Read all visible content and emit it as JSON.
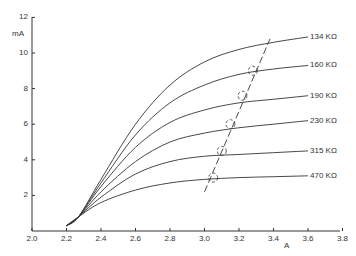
{
  "chart_data": {
    "type": "line",
    "title": "",
    "xlabel": "A",
    "ylabel": "mA",
    "xlim": [
      2.0,
      3.8
    ],
    "ylim": [
      0,
      12
    ],
    "grid": false,
    "x_ticks": [
      "2.0",
      "2.2",
      "2.4",
      "2.6",
      "2.8",
      "3.0",
      "3.2",
      "3.4",
      "3.6",
      "3.8"
    ],
    "y_ticks": [
      "2",
      "4",
      "6",
      "8",
      "10",
      "12"
    ],
    "series": [
      {
        "name": "134 KΩ",
        "x": [
          2.2,
          2.27,
          2.4,
          2.6,
          2.8,
          3.0,
          3.2,
          3.4,
          3.6
        ],
        "values": [
          0.3,
          0.8,
          2.9,
          6.0,
          8.2,
          9.5,
          10.2,
          10.6,
          10.9
        ]
      },
      {
        "name": "160 KΩ",
        "x": [
          2.2,
          2.27,
          2.4,
          2.6,
          2.8,
          3.0,
          3.2,
          3.4,
          3.6
        ],
        "values": [
          0.3,
          0.8,
          2.7,
          5.4,
          7.2,
          8.2,
          8.8,
          9.1,
          9.3
        ]
      },
      {
        "name": "190 KΩ",
        "x": [
          2.2,
          2.27,
          2.4,
          2.6,
          2.8,
          3.0,
          3.2,
          3.4,
          3.6
        ],
        "values": [
          0.3,
          0.8,
          2.5,
          4.7,
          6.1,
          6.8,
          7.2,
          7.4,
          7.6
        ]
      },
      {
        "name": "230 KΩ",
        "x": [
          2.2,
          2.27,
          2.4,
          2.6,
          2.8,
          3.0,
          3.2,
          3.4,
          3.6
        ],
        "values": [
          0.3,
          0.8,
          2.2,
          3.9,
          5.0,
          5.5,
          5.8,
          6.0,
          6.2
        ]
      },
      {
        "name": "315 KΩ",
        "x": [
          2.2,
          2.27,
          2.4,
          2.6,
          2.8,
          3.0,
          3.2,
          3.4,
          3.6
        ],
        "values": [
          0.3,
          0.8,
          1.9,
          3.2,
          3.9,
          4.2,
          4.3,
          4.4,
          4.5
        ]
      },
      {
        "name": "470 KΩ",
        "x": [
          2.2,
          2.27,
          2.4,
          2.6,
          2.8,
          3.0,
          3.2,
          3.4,
          3.6
        ],
        "values": [
          0.3,
          0.8,
          1.6,
          2.3,
          2.7,
          2.9,
          3.0,
          3.05,
          3.1
        ]
      }
    ],
    "annotations": {
      "dashed_line": {
        "x": [
          3.0,
          3.38
        ],
        "values": [
          2.2,
          10.8
        ]
      },
      "dashed_circles": [
        {
          "x": 3.05,
          "value": 3.0
        },
        {
          "x": 3.1,
          "value": 4.5
        },
        {
          "x": 3.15,
          "value": 6.0
        },
        {
          "x": 3.22,
          "value": 7.6
        },
        {
          "x": 3.28,
          "value": 9.0
        }
      ]
    },
    "legend": "inline labels at right end of curves"
  }
}
